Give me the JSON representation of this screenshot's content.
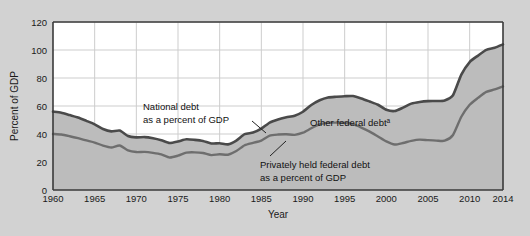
{
  "chart_data": {
    "type": "area",
    "title": "",
    "xlabel": "Year",
    "ylabel": "Percent of GDP",
    "xlim": [
      1960,
      2014
    ],
    "ylim": [
      0,
      120
    ],
    "grid": true,
    "legend_position": "inline-annotations",
    "y_ticks": [
      0,
      20,
      40,
      60,
      80,
      100,
      120
    ],
    "x_ticks": [
      1960,
      1965,
      1970,
      1975,
      1980,
      1985,
      1990,
      1995,
      2000,
      2005,
      2010,
      2014
    ],
    "x_tick_labels": [
      "1960",
      "1965",
      "1970",
      "1975",
      "1980",
      "1985",
      "1990",
      "1995",
      "2000",
      "2005",
      "2010",
      "2014"
    ],
    "y_tick_labels": [
      "0",
      "20",
      "40",
      "60",
      "80",
      "100",
      "120"
    ],
    "annotations": [
      {
        "name": "national-debt-label",
        "line1": "National debt",
        "line2": "as a percent of GDP"
      },
      {
        "name": "other-federal-debt-label",
        "text": "Other federal debt",
        "superscript": "a"
      },
      {
        "name": "privately-held-label",
        "line1": "Privately held federal debt",
        "line2": "as a percent of GDP"
      }
    ],
    "x": [
      1960,
      1961,
      1962,
      1963,
      1964,
      1965,
      1966,
      1967,
      1968,
      1969,
      1970,
      1971,
      1972,
      1973,
      1974,
      1975,
      1976,
      1977,
      1978,
      1979,
      1980,
      1981,
      1982,
      1983,
      1984,
      1985,
      1986,
      1987,
      1988,
      1989,
      1990,
      1991,
      1992,
      1993,
      1994,
      1995,
      1996,
      1997,
      1998,
      1999,
      2000,
      2001,
      2002,
      2003,
      2004,
      2005,
      2006,
      2007,
      2008,
      2009,
      2010,
      2011,
      2012,
      2013,
      2014
    ],
    "series": [
      {
        "name": "National debt as a percent of GDP",
        "color": "#4a4a4a",
        "values": [
          56.0,
          55.2,
          53.5,
          51.8,
          49.4,
          46.9,
          43.6,
          41.9,
          42.5,
          38.6,
          37.6,
          37.8,
          37.0,
          35.6,
          33.6,
          34.7,
          36.2,
          35.8,
          35.0,
          33.2,
          33.4,
          32.6,
          35.3,
          39.9,
          41.0,
          43.8,
          48.2,
          50.4,
          51.9,
          53.1,
          55.9,
          60.7,
          64.1,
          66.1,
          66.6,
          67.0,
          67.1,
          65.4,
          63.2,
          60.9,
          57.3,
          56.4,
          58.8,
          61.7,
          62.9,
          63.5,
          63.6,
          64.0,
          67.7,
          82.4,
          91.4,
          96.0,
          100.1,
          101.6,
          104.0
        ]
      },
      {
        "name": "Privately held federal debt as a percent of GDP",
        "color": "#6e6e6e",
        "values": [
          40.0,
          39.6,
          38.4,
          37.0,
          35.4,
          33.9,
          31.7,
          30.4,
          31.8,
          28.3,
          27.1,
          27.2,
          26.5,
          25.4,
          23.2,
          24.5,
          26.7,
          26.9,
          26.4,
          24.9,
          25.5,
          25.2,
          27.8,
          32.0,
          33.7,
          35.3,
          38.8,
          39.6,
          39.8,
          39.4,
          40.9,
          44.1,
          46.8,
          48.1,
          48.1,
          48.0,
          47.0,
          44.6,
          41.7,
          38.2,
          34.7,
          32.5,
          33.6,
          35.1,
          36.0,
          35.6,
          35.3,
          35.2,
          39.3,
          52.3,
          60.9,
          65.8,
          70.1,
          71.8,
          74.0
        ]
      }
    ],
    "fill_between_note": "Area between the two curves is labelled 'Other federal debt'"
  },
  "colors": {
    "page_background": "#d2d2d2",
    "plot_background": "#ffffff",
    "area_fill": "#bdbdbd",
    "upper_line": "#4a4a4a",
    "lower_line": "#6e6e6e",
    "gridline": "#cccccc",
    "axis": "#3a3a3a",
    "text": "#111111"
  }
}
